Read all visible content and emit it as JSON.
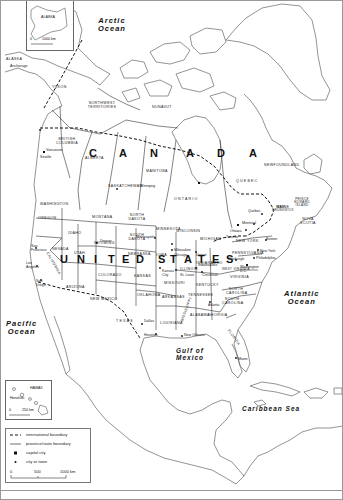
{
  "map": {
    "type": "political reference map",
    "region": "North America"
  },
  "oceans": {
    "arctic": "Arctic\nOcean",
    "pacific": "Pacific\nOcean",
    "atlantic": "Atlantic\nOcean",
    "gulf": "Gulf of\nMexico",
    "caribbean": "Caribbean Sea"
  },
  "countries": {
    "canada": [
      "C",
      "A",
      "N",
      "A",
      "D",
      "A"
    ],
    "usa": [
      "U",
      "N",
      "I",
      "T",
      "E",
      "D",
      "S",
      "T",
      "A",
      "T",
      "E",
      "S"
    ]
  },
  "canada_regions": [
    {
      "name": "YUKON"
    },
    {
      "name": "NORTHWEST TERRITORIES"
    },
    {
      "name": "NUNAVUT"
    },
    {
      "name": "BRITISH COLUMBIA"
    },
    {
      "name": "ALBERTA"
    },
    {
      "name": "SASKATCHEWAN"
    },
    {
      "name": "MANITOBA"
    },
    {
      "name": "ONTARIO"
    },
    {
      "name": "QUEBEC"
    },
    {
      "name": "NEWFOUNDLAND"
    },
    {
      "name": "NOVA SCOTIA"
    },
    {
      "name": "NEW BRUNSWICK"
    },
    {
      "name": "PRINCE EDWARD ISLAND"
    }
  ],
  "us_states": [
    {
      "name": "ALASKA"
    },
    {
      "name": "WASHINGTON"
    },
    {
      "name": "OREGON"
    },
    {
      "name": "CALIFORNIA"
    },
    {
      "name": "NEVADA"
    },
    {
      "name": "IDAHO"
    },
    {
      "name": "MONTANA"
    },
    {
      "name": "WYOMING"
    },
    {
      "name": "UTAH"
    },
    {
      "name": "ARIZONA"
    },
    {
      "name": "COLORADO"
    },
    {
      "name": "NEW MEXICO"
    },
    {
      "name": "NORTH DAKOTA"
    },
    {
      "name": "SOUTH DAKOTA"
    },
    {
      "name": "NEBRASKA"
    },
    {
      "name": "KANSAS"
    },
    {
      "name": "OKLAHOMA"
    },
    {
      "name": "TEXAS"
    },
    {
      "name": "MINNESOTA"
    },
    {
      "name": "IOWA"
    },
    {
      "name": "MISSOURI"
    },
    {
      "name": "ARKANSAS"
    },
    {
      "name": "LOUISIANA"
    },
    {
      "name": "WISCONSIN"
    },
    {
      "name": "ILLINOIS"
    },
    {
      "name": "MICHIGAN"
    },
    {
      "name": "INDIANA"
    },
    {
      "name": "OHIO"
    },
    {
      "name": "KENTUCKY"
    },
    {
      "name": "TENNESSEE"
    },
    {
      "name": "MISSISSIPPI"
    },
    {
      "name": "ALABAMA"
    },
    {
      "name": "GEORGIA"
    },
    {
      "name": "FLORIDA"
    },
    {
      "name": "SOUTH CAROLINA"
    },
    {
      "name": "NORTH CAROLINA"
    },
    {
      "name": "VIRGINIA"
    },
    {
      "name": "WEST VIRGINIA"
    },
    {
      "name": "PENNSYLVANIA"
    },
    {
      "name": "NEW YORK"
    },
    {
      "name": "MAINE"
    },
    {
      "name": "HAWAII"
    }
  ],
  "cities": [
    {
      "name": "Anchorage"
    },
    {
      "name": "Vancouver"
    },
    {
      "name": "Seattle"
    },
    {
      "name": "San Francisco"
    },
    {
      "name": "Los Angeles"
    },
    {
      "name": "San Diego"
    },
    {
      "name": "Denver"
    },
    {
      "name": "Winnipeg"
    },
    {
      "name": "Minneapolis"
    },
    {
      "name": "Milwaukee"
    },
    {
      "name": "Chicago"
    },
    {
      "name": "Detroit"
    },
    {
      "name": "Kansas City"
    },
    {
      "name": "St. Louis"
    },
    {
      "name": "Indianapolis"
    },
    {
      "name": "Cincinnati"
    },
    {
      "name": "Dallas"
    },
    {
      "name": "Houston"
    },
    {
      "name": "New Orleans"
    },
    {
      "name": "Atlanta"
    },
    {
      "name": "Miami"
    },
    {
      "name": "Ottawa"
    },
    {
      "name": "Toronto"
    },
    {
      "name": "Montreal"
    },
    {
      "name": "Quebec"
    },
    {
      "name": "Boston"
    },
    {
      "name": "New York"
    },
    {
      "name": "Philadelphia"
    },
    {
      "name": "Pittsburgh"
    },
    {
      "name": "Washington D.C."
    },
    {
      "name": "Honolulu"
    }
  ],
  "insets": {
    "alaska": {
      "label": "ALASKA",
      "scale_zero": "0",
      "scale_end": "1000 km"
    },
    "hawaii": {
      "label": "HAWAII",
      "city": "Honolulu",
      "scale_zero": "0",
      "scale_end": "250 km"
    }
  },
  "legend": {
    "items": [
      {
        "symbol": "dashed-line",
        "label": "international boundary"
      },
      {
        "symbol": "solid-line",
        "label": "province/state boundary"
      },
      {
        "symbol": "square",
        "label": "capital city"
      },
      {
        "symbol": "dot",
        "label": "city or town"
      }
    ],
    "scale": {
      "zero": "0",
      "mid": "500",
      "end": "1000 km"
    }
  },
  "colors": {
    "land_fill": "#ffffff",
    "outline": "#555555",
    "boundary": "#222222",
    "text": "#111111"
  }
}
